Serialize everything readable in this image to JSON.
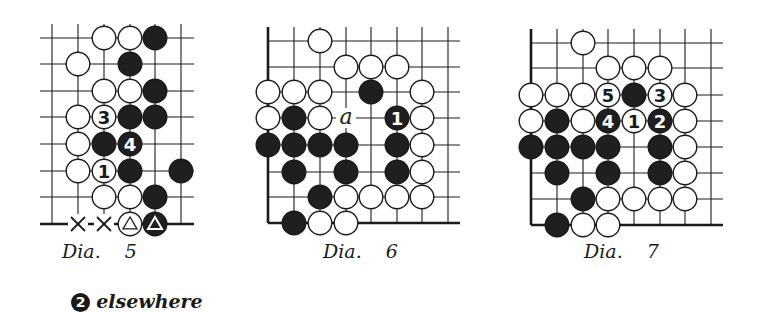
{
  "colors": {
    "ink": "#1a1a1a",
    "paper": "#ffffff",
    "white_stone_fill": "#ffffff",
    "black_stone_fill": "#1f1f1f"
  },
  "diagrams": [
    {
      "id": "dia5",
      "caption": "Dia.    5",
      "caption_pos": [
        62,
        240
      ],
      "note": {
        "badge": "2",
        "text": "elsewhere",
        "pos": [
          58,
          268
        ]
      },
      "cols_x": [
        52,
        78,
        104,
        130,
        155,
        181
      ],
      "rows_y": [
        38,
        64,
        91,
        117,
        144,
        171,
        197,
        224
      ],
      "line_extent": {
        "left": 40,
        "right": 194,
        "top": 24,
        "bottom": 224
      },
      "edges": {
        "left": false,
        "bottom": true,
        "right": false,
        "top": false
      },
      "stones": [
        {
          "c": 2,
          "r": 0,
          "color": "white"
        },
        {
          "c": 3,
          "r": 0,
          "color": "white"
        },
        {
          "c": 4,
          "r": 0,
          "color": "black"
        },
        {
          "c": 1,
          "r": 1,
          "color": "white"
        },
        {
          "c": 3,
          "r": 1,
          "color": "black"
        },
        {
          "c": 2,
          "r": 2,
          "color": "white"
        },
        {
          "c": 3,
          "r": 2,
          "color": "white"
        },
        {
          "c": 4,
          "r": 2,
          "color": "black"
        },
        {
          "c": 1,
          "r": 3,
          "color": "white"
        },
        {
          "c": 2,
          "r": 3,
          "color": "white",
          "label": "3"
        },
        {
          "c": 3,
          "r": 3,
          "color": "black"
        },
        {
          "c": 4,
          "r": 3,
          "color": "black"
        },
        {
          "c": 1,
          "r": 4,
          "color": "white"
        },
        {
          "c": 2,
          "r": 4,
          "color": "black"
        },
        {
          "c": 3,
          "r": 4,
          "color": "black",
          "label": "4"
        },
        {
          "c": 1,
          "r": 5,
          "color": "white"
        },
        {
          "c": 2,
          "r": 5,
          "color": "white",
          "label": "1"
        },
        {
          "c": 3,
          "r": 5,
          "color": "black"
        },
        {
          "c": 5,
          "r": 5,
          "color": "black"
        },
        {
          "c": 2,
          "r": 6,
          "color": "white"
        },
        {
          "c": 3,
          "r": 6,
          "color": "white"
        },
        {
          "c": 4,
          "r": 6,
          "color": "black"
        },
        {
          "c": 3,
          "r": 7,
          "color": "white",
          "mark": "triangle"
        },
        {
          "c": 4,
          "r": 7,
          "color": "black",
          "mark": "triangle"
        }
      ],
      "marks": [
        {
          "c": 1,
          "r": 7,
          "type": "cross"
        },
        {
          "c": 2,
          "r": 7,
          "type": "cross"
        }
      ],
      "letters": []
    },
    {
      "id": "dia6",
      "caption": "Dia.    6",
      "caption_pos": [
        323,
        240
      ],
      "cols_x": [
        268,
        294,
        320,
        346,
        371,
        397,
        422,
        448
      ],
      "rows_y": [
        41,
        67,
        92,
        118,
        145,
        172,
        197,
        223
      ],
      "line_extent": {
        "left": 268,
        "right": 460,
        "top": 27,
        "bottom": 223
      },
      "edges": {
        "left": true,
        "bottom": true,
        "right": false,
        "top": false
      },
      "stones": [
        {
          "c": 2,
          "r": 0,
          "color": "white"
        },
        {
          "c": 3,
          "r": 1,
          "color": "white"
        },
        {
          "c": 4,
          "r": 1,
          "color": "white"
        },
        {
          "c": 5,
          "r": 1,
          "color": "white"
        },
        {
          "c": 0,
          "r": 2,
          "color": "white"
        },
        {
          "c": 1,
          "r": 2,
          "color": "white"
        },
        {
          "c": 2,
          "r": 2,
          "color": "white"
        },
        {
          "c": 4,
          "r": 2,
          "color": "black"
        },
        {
          "c": 6,
          "r": 2,
          "color": "white"
        },
        {
          "c": 0,
          "r": 3,
          "color": "white"
        },
        {
          "c": 1,
          "r": 3,
          "color": "black"
        },
        {
          "c": 2,
          "r": 3,
          "color": "white"
        },
        {
          "c": 5,
          "r": 3,
          "color": "black",
          "label": "1"
        },
        {
          "c": 6,
          "r": 3,
          "color": "white"
        },
        {
          "c": 0,
          "r": 4,
          "color": "black"
        },
        {
          "c": 1,
          "r": 4,
          "color": "black"
        },
        {
          "c": 2,
          "r": 4,
          "color": "black"
        },
        {
          "c": 3,
          "r": 4,
          "color": "black"
        },
        {
          "c": 5,
          "r": 4,
          "color": "black"
        },
        {
          "c": 6,
          "r": 4,
          "color": "white"
        },
        {
          "c": 1,
          "r": 5,
          "color": "black"
        },
        {
          "c": 3,
          "r": 5,
          "color": "black"
        },
        {
          "c": 5,
          "r": 5,
          "color": "black"
        },
        {
          "c": 6,
          "r": 5,
          "color": "white"
        },
        {
          "c": 2,
          "r": 6,
          "color": "black"
        },
        {
          "c": 3,
          "r": 6,
          "color": "white"
        },
        {
          "c": 4,
          "r": 6,
          "color": "white"
        },
        {
          "c": 5,
          "r": 6,
          "color": "white"
        },
        {
          "c": 6,
          "r": 6,
          "color": "white"
        },
        {
          "c": 1,
          "r": 7,
          "color": "black"
        },
        {
          "c": 2,
          "r": 7,
          "color": "white"
        },
        {
          "c": 3,
          "r": 7,
          "color": "white"
        }
      ],
      "marks": [],
      "letters": [
        {
          "c": 3,
          "r": 3,
          "text": "a"
        }
      ]
    },
    {
      "id": "dia7",
      "caption": "Dia.    7",
      "caption_pos": [
        584,
        240
      ],
      "cols_x": [
        531,
        557,
        583,
        608,
        634,
        660,
        685,
        711
      ],
      "rows_y": [
        43,
        68,
        95,
        121,
        147,
        173,
        199,
        225
      ],
      "line_extent": {
        "left": 531,
        "right": 723,
        "top": 29,
        "bottom": 225
      },
      "edges": {
        "left": true,
        "bottom": true,
        "right": false,
        "top": false
      },
      "stones": [
        {
          "c": 2,
          "r": 0,
          "color": "white"
        },
        {
          "c": 3,
          "r": 1,
          "color": "white"
        },
        {
          "c": 4,
          "r": 1,
          "color": "white"
        },
        {
          "c": 5,
          "r": 1,
          "color": "white"
        },
        {
          "c": 0,
          "r": 2,
          "color": "white"
        },
        {
          "c": 1,
          "r": 2,
          "color": "white"
        },
        {
          "c": 2,
          "r": 2,
          "color": "white"
        },
        {
          "c": 3,
          "r": 2,
          "color": "white",
          "label": "5"
        },
        {
          "c": 4,
          "r": 2,
          "color": "black"
        },
        {
          "c": 5,
          "r": 2,
          "color": "white",
          "label": "3"
        },
        {
          "c": 6,
          "r": 2,
          "color": "white"
        },
        {
          "c": 0,
          "r": 3,
          "color": "white"
        },
        {
          "c": 1,
          "r": 3,
          "color": "black"
        },
        {
          "c": 2,
          "r": 3,
          "color": "white"
        },
        {
          "c": 3,
          "r": 3,
          "color": "black",
          "label": "4"
        },
        {
          "c": 4,
          "r": 3,
          "color": "white",
          "label": "1"
        },
        {
          "c": 5,
          "r": 3,
          "color": "black",
          "label": "2"
        },
        {
          "c": 6,
          "r": 3,
          "color": "white"
        },
        {
          "c": 0,
          "r": 4,
          "color": "black"
        },
        {
          "c": 1,
          "r": 4,
          "color": "black"
        },
        {
          "c": 2,
          "r": 4,
          "color": "black"
        },
        {
          "c": 3,
          "r": 4,
          "color": "black"
        },
        {
          "c": 5,
          "r": 4,
          "color": "black"
        },
        {
          "c": 6,
          "r": 4,
          "color": "white"
        },
        {
          "c": 1,
          "r": 5,
          "color": "black"
        },
        {
          "c": 3,
          "r": 5,
          "color": "black"
        },
        {
          "c": 5,
          "r": 5,
          "color": "black"
        },
        {
          "c": 6,
          "r": 5,
          "color": "white"
        },
        {
          "c": 2,
          "r": 6,
          "color": "black"
        },
        {
          "c": 3,
          "r": 6,
          "color": "white"
        },
        {
          "c": 4,
          "r": 6,
          "color": "white"
        },
        {
          "c": 5,
          "r": 6,
          "color": "white"
        },
        {
          "c": 6,
          "r": 6,
          "color": "white"
        },
        {
          "c": 1,
          "r": 7,
          "color": "black"
        },
        {
          "c": 2,
          "r": 7,
          "color": "white"
        },
        {
          "c": 3,
          "r": 7,
          "color": "white"
        }
      ],
      "marks": [],
      "letters": []
    }
  ]
}
